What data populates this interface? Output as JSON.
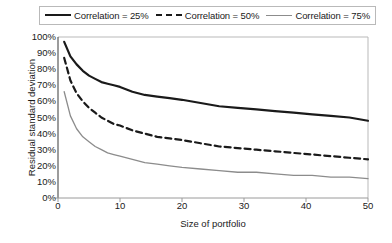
{
  "chart_data": {
    "type": "line",
    "title": "",
    "xlabel": "Size of portfolio",
    "ylabel": "Residual standard deviation",
    "xlim": [
      0,
      50
    ],
    "ylim": [
      0,
      1.0
    ],
    "grid": false,
    "legend_position": "top",
    "xticks": [
      "0",
      "10",
      "20",
      "30",
      "40",
      "50"
    ],
    "xtick_values": [
      0,
      10,
      20,
      30,
      40,
      50
    ],
    "yticks": [
      "0%",
      "10%",
      "20%",
      "30%",
      "40%",
      "50%",
      "60%",
      "70%",
      "80%",
      "90%",
      "100%"
    ],
    "ytick_values": [
      0,
      10,
      20,
      30,
      40,
      50,
      60,
      70,
      80,
      90,
      100
    ],
    "x": [
      1,
      2,
      3,
      4,
      5,
      6,
      7,
      8,
      9,
      10,
      12,
      14,
      16,
      18,
      20,
      23,
      26,
      29,
      32,
      35,
      38,
      41,
      44,
      47,
      50
    ],
    "series": [
      {
        "name": "Correlation = 25%",
        "style": "solid",
        "color": "#1a1a1a",
        "width": 2.2,
        "values": [
          97,
          88,
          83,
          79,
          76,
          74,
          72,
          71,
          70,
          69,
          66,
          64,
          63,
          62,
          61,
          59,
          57,
          56,
          55,
          54,
          53,
          52,
          51,
          50,
          48
        ]
      },
      {
        "name": "Correlation = 50%",
        "style": "dashed",
        "color": "#1a1a1a",
        "width": 2.2,
        "values": [
          87,
          73,
          65,
          60,
          56,
          53,
          50,
          48,
          46,
          45,
          42,
          40,
          38,
          37,
          36,
          34,
          32,
          31,
          30,
          29,
          28,
          27,
          26,
          25,
          24
        ]
      },
      {
        "name": "Correlation = 75%",
        "style": "solid",
        "color": "#8c8c8c",
        "width": 1.3,
        "values": [
          66,
          51,
          43,
          38,
          35,
          32,
          30,
          28,
          27,
          26,
          24,
          22,
          21,
          20,
          19,
          18,
          17,
          16,
          16,
          15,
          14,
          14,
          13,
          13,
          12
        ]
      }
    ]
  },
  "legend": {
    "items": [
      {
        "label": "Correlation = 25%"
      },
      {
        "label": "Correlation = 50%"
      },
      {
        "label": "Correlation = 75%"
      }
    ]
  },
  "axes": {
    "x_title": "Size of portfolio",
    "y_title": "Residual standard deviation"
  },
  "colors": {
    "series_dark": "#1a1a1a",
    "series_gray": "#8c8c8c",
    "axis": "#b9b9b9",
    "background": "#ffffff"
  }
}
